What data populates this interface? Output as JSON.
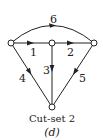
{
  "diagram": {
    "caption": "Cut-set 2",
    "sublabel": "(d)",
    "nodes": [
      {
        "id": "left",
        "x": 11,
        "y": 43
      },
      {
        "id": "mid",
        "x": 52,
        "y": 43
      },
      {
        "id": "right",
        "x": 94,
        "y": 43
      },
      {
        "id": "bottom",
        "x": 52,
        "y": 107
      }
    ],
    "edges": [
      {
        "label": "1",
        "from": "left",
        "to": "mid"
      },
      {
        "label": "2",
        "from": "mid",
        "to": "right"
      },
      {
        "label": "3",
        "from": "mid",
        "to": "bottom"
      },
      {
        "label": "4",
        "from": "left",
        "to": "bottom"
      },
      {
        "label": "5",
        "from": "right",
        "to": "bottom"
      },
      {
        "label": "6",
        "from": "right",
        "to": "left",
        "curved": true
      }
    ]
  }
}
